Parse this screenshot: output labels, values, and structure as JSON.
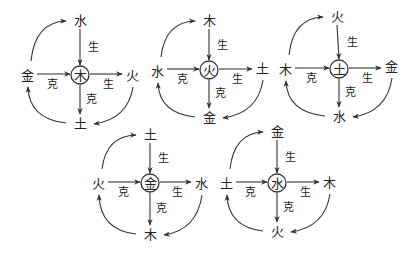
{
  "labels": {
    "sheng": "生",
    "ke": "克"
  },
  "diagrams": [
    {
      "center": "木",
      "top": "水",
      "left": "金",
      "right": "火",
      "bottom": "土",
      "pos": {
        "cx": 80,
        "cy": 75,
        "tx": 80,
        "ty": 20,
        "lx": 27,
        "ly": 75,
        "rx": 132,
        "ry": 75,
        "bx": 80,
        "by": 123
      }
    },
    {
      "center": "火",
      "top": "木",
      "left": "水",
      "right": "土",
      "bottom": "金",
      "pos": {
        "cx": 209,
        "cy": 70,
        "tx": 209,
        "ty": 20,
        "lx": 157,
        "ly": 71,
        "rx": 262,
        "ry": 68,
        "bx": 209,
        "by": 117
      }
    },
    {
      "center": "土",
      "top": "火",
      "left": "木",
      "right": "金",
      "bottom": "水",
      "pos": {
        "cx": 339,
        "cy": 69,
        "tx": 337,
        "ty": 16,
        "lx": 285,
        "ly": 69,
        "rx": 391,
        "ry": 66,
        "bx": 339,
        "by": 116
      }
    },
    {
      "center": "金",
      "top": "土",
      "left": "火",
      "right": "水",
      "bottom": "木",
      "pos": {
        "cx": 150,
        "cy": 183,
        "tx": 150,
        "ty": 134,
        "lx": 98,
        "ly": 183,
        "rx": 201,
        "ry": 183,
        "bx": 150,
        "by": 234
      }
    },
    {
      "center": "水",
      "top": "金",
      "left": "土",
      "right": "木",
      "bottom": "火",
      "pos": {
        "cx": 277,
        "cy": 183,
        "tx": 277,
        "ty": 131,
        "lx": 226,
        "ly": 183,
        "rx": 329,
        "ry": 182,
        "bx": 277,
        "by": 231
      }
    }
  ]
}
